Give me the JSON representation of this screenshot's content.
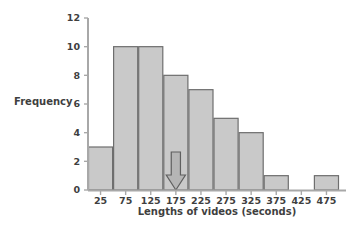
{
  "chart_data": {
    "type": "bar",
    "title": "",
    "subtitle": "",
    "xlabel": "Lengths of videos (seconds)",
    "ylabel": "Frequency",
    "categories": [
      "25",
      "75",
      "125",
      "175",
      "225",
      "275",
      "325",
      "375",
      "425",
      "475"
    ],
    "values": [
      3,
      10,
      10,
      8,
      7,
      5,
      4,
      1,
      0,
      1
    ],
    "bin_width": 50,
    "bin_edges": [
      0,
      50,
      100,
      150,
      200,
      250,
      300,
      350,
      400,
      450,
      500
    ],
    "ylim": [
      0,
      12
    ],
    "yticks": [
      0,
      2,
      4,
      6,
      8,
      10,
      12
    ],
    "ytick_labels": [
      "0",
      "2",
      "4",
      "6",
      "8",
      "10",
      "12"
    ],
    "xtick_labels": [
      "25",
      "75",
      "125",
      "175",
      "225",
      "275",
      "325",
      "375",
      "425",
      "475"
    ],
    "grid": false,
    "legend": "none",
    "bar_fill": "#c9c9c9",
    "bar_stroke": "#6e6e6e",
    "axis_color": "#9a9a9a",
    "annotations": [
      {
        "kind": "down-arrow",
        "at_category": "175",
        "fill": "#b5b5b5",
        "stroke": "#5f5f5f",
        "label": ""
      }
    ]
  },
  "axes": {
    "y_title": "Frequency",
    "x_title": "Lengths of videos (seconds)"
  }
}
